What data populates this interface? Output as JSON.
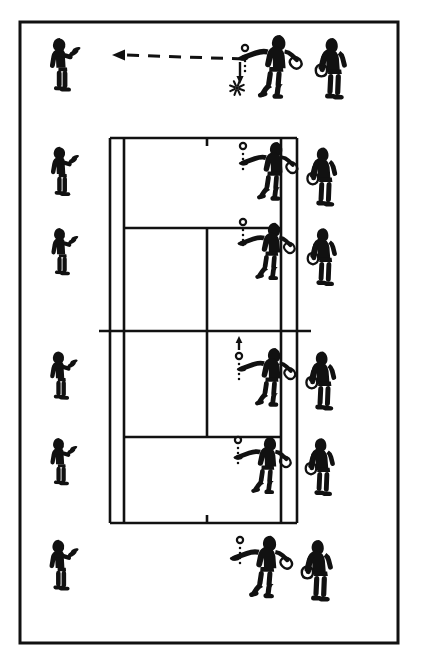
{
  "figure": {
    "background_color": "#ffffff",
    "ink_color": "#111111",
    "border": {
      "name": "figure-frame",
      "x": 20,
      "y": 22,
      "width": 378,
      "height": 621,
      "stroke_width": 3
    }
  },
  "court": {
    "name": "tennis-court",
    "orientation": "vertical",
    "stroke_width": 2.6,
    "doubles_left_x": 110,
    "singles_left_x": 124,
    "singles_right_x": 281,
    "doubles_right_x": 297,
    "top_baseline_y": 138,
    "bottom_baseline_y": 523,
    "net_y": 331,
    "top_service_line_y": 228,
    "bottom_service_line_y": 437,
    "center_service_line_x": 207,
    "net_extension_left_x": 99,
    "net_extension_right_x": 311,
    "center_mark_length": 8,
    "lines": [
      {
        "label": "top-baseline",
        "type": "horizontal"
      },
      {
        "label": "bottom-baseline",
        "type": "horizontal"
      },
      {
        "label": "net",
        "type": "horizontal"
      },
      {
        "label": "top-service-line",
        "type": "horizontal"
      },
      {
        "label": "bottom-service-line",
        "type": "horizontal"
      },
      {
        "label": "left-doubles-sideline",
        "type": "vertical"
      },
      {
        "label": "left-singles-sideline",
        "type": "vertical"
      },
      {
        "label": "right-singles-sideline",
        "type": "vertical"
      },
      {
        "label": "right-doubles-sideline",
        "type": "vertical"
      },
      {
        "label": "center-service-line",
        "type": "vertical"
      },
      {
        "label": "top-center-mark",
        "type": "tick"
      },
      {
        "label": "bottom-center-mark",
        "type": "tick"
      }
    ]
  },
  "rows": [
    {
      "id": "row-1",
      "label": "row-1-behind-baseline",
      "y": 72,
      "receiver": {
        "name": "receiver-figure",
        "x": 62,
        "y": 72,
        "scale": 1.0,
        "pose": "ready-stance-waiting"
      },
      "hitter": {
        "name": "hitter-figure",
        "x": 272,
        "y": 72,
        "scale": 1.0,
        "pose": "forehand-drop-and-hit"
      },
      "feeder": {
        "name": "next-player-figure",
        "x": 331,
        "y": 74,
        "scale": 1.0,
        "pose": "standing-with-racket"
      },
      "ball": {
        "name": "ball-marker",
        "x": 245,
        "y": 48,
        "dotted_tail": true
      },
      "bounce": {
        "name": "ball-bounce-burst",
        "x": 237,
        "y": 88,
        "show": true
      },
      "drop_arrow": {
        "name": "ball-drop-arrow",
        "x": 240,
        "y": 62,
        "length": 18,
        "show": true
      },
      "trajectory_arrow": {
        "name": "shot-direction-arrow",
        "show": true,
        "from_x": 244,
        "from_y": 59,
        "to_x": 112,
        "to_y": 55,
        "dash": "12 9",
        "head": "left"
      }
    },
    {
      "id": "row-2",
      "label": "row-2-top-deuce-area",
      "y": 178,
      "receiver": {
        "name": "receiver-figure",
        "x": 62,
        "y": 178,
        "scale": 0.92,
        "pose": "ready-stance-waiting"
      },
      "hitter": {
        "name": "hitter-figure",
        "x": 270,
        "y": 176,
        "scale": 0.92,
        "pose": "forehand-drop-and-hit"
      },
      "feeder": {
        "name": "next-player-figure",
        "x": 322,
        "y": 182,
        "scale": 0.96,
        "pose": "standing-with-racket"
      },
      "ball": {
        "name": "ball-marker",
        "x": 243,
        "y": 146,
        "dotted_tail": true
      },
      "bounce": {
        "name": "ball-bounce-burst",
        "x": 0,
        "y": 0,
        "show": false
      },
      "drop_arrow": {
        "name": "ball-drop-arrow",
        "x": 0,
        "y": 0,
        "length": 0,
        "show": false
      },
      "trajectory_arrow": {
        "name": "shot-direction-arrow",
        "show": false
      }
    },
    {
      "id": "row-3",
      "label": "row-3-top-service-box",
      "y": 258,
      "receiver": {
        "name": "receiver-figure",
        "x": 62,
        "y": 258,
        "scale": 0.88,
        "pose": "ready-stance-waiting"
      },
      "hitter": {
        "name": "hitter-figure",
        "x": 268,
        "y": 256,
        "scale": 0.9,
        "pose": "forehand-drop-and-hit"
      },
      "feeder": {
        "name": "next-player-figure",
        "x": 322,
        "y": 262,
        "scale": 0.94,
        "pose": "standing-with-racket"
      },
      "ball": {
        "name": "ball-marker",
        "x": 243,
        "y": 222,
        "dotted_tail": true
      },
      "bounce": {
        "name": "ball-bounce-burst",
        "x": 0,
        "y": 0,
        "show": false
      },
      "drop_arrow": {
        "name": "ball-drop-arrow",
        "x": 0,
        "y": 0,
        "length": 0,
        "show": false
      },
      "trajectory_arrow": {
        "name": "shot-direction-arrow",
        "show": false
      }
    },
    {
      "id": "row-4",
      "label": "row-4-below-net",
      "y": 382,
      "receiver": {
        "name": "receiver-figure",
        "x": 61,
        "y": 382,
        "scale": 0.9,
        "pose": "ready-stance-waiting"
      },
      "hitter": {
        "name": "hitter-figure",
        "x": 268,
        "y": 382,
        "scale": 0.92,
        "pose": "forehand-drop-and-hit"
      },
      "feeder": {
        "name": "next-player-figure",
        "x": 321,
        "y": 386,
        "scale": 0.96,
        "pose": "standing-with-racket"
      },
      "ball": {
        "name": "ball-marker",
        "x": 239,
        "y": 356,
        "dotted_tail": true
      },
      "bounce": {
        "name": "ball-bounce-burst",
        "x": 0,
        "y": 0,
        "show": false
      },
      "drop_arrow": {
        "name": "ball-drop-arrow",
        "x": 0,
        "y": 0,
        "length": 0,
        "show": false
      },
      "trajectory_arrow": {
        "name": "shot-direction-arrow",
        "show": false
      },
      "up_arrow": {
        "name": "ball-toss-up-arrow",
        "x": 239,
        "y": 350,
        "show": true
      }
    },
    {
      "id": "row-5",
      "label": "row-5-bottom-service-box",
      "y": 468,
      "receiver": {
        "name": "receiver-figure",
        "x": 61,
        "y": 468,
        "scale": 0.88,
        "pose": "ready-stance-waiting"
      },
      "hitter": {
        "name": "hitter-figure",
        "x": 264,
        "y": 470,
        "scale": 0.9,
        "pose": "forehand-drop-and-hit"
      },
      "feeder": {
        "name": "next-player-figure",
        "x": 320,
        "y": 472,
        "scale": 0.94,
        "pose": "standing-with-racket"
      },
      "ball": {
        "name": "ball-marker",
        "x": 238,
        "y": 440,
        "dotted_tail": true
      },
      "bounce": {
        "name": "ball-bounce-burst",
        "x": 0,
        "y": 0,
        "show": false
      },
      "drop_arrow": {
        "name": "ball-drop-arrow",
        "x": 0,
        "y": 0,
        "length": 0,
        "show": false
      },
      "trajectory_arrow": {
        "name": "shot-direction-arrow",
        "show": false
      }
    },
    {
      "id": "row-6",
      "label": "row-6-behind-bottom-baseline",
      "y": 572,
      "receiver": {
        "name": "receiver-figure",
        "x": 61,
        "y": 572,
        "scale": 0.95,
        "pose": "ready-stance-waiting"
      },
      "hitter": {
        "name": "hitter-figure",
        "x": 263,
        "y": 572,
        "scale": 0.98,
        "pose": "forehand-drop-and-hit"
      },
      "feeder": {
        "name": "next-player-figure",
        "x": 317,
        "y": 576,
        "scale": 1.0,
        "pose": "standing-with-racket"
      },
      "ball": {
        "name": "ball-marker",
        "x": 240,
        "y": 540,
        "dotted_tail": true
      },
      "bounce": {
        "name": "ball-bounce-burst",
        "x": 0,
        "y": 0,
        "show": false
      },
      "drop_arrow": {
        "name": "ball-drop-arrow",
        "x": 0,
        "y": 0,
        "length": 0,
        "show": false
      },
      "trajectory_arrow": {
        "name": "shot-direction-arrow",
        "show": false
      }
    }
  ],
  "legend": {
    "ball_symbol": "small open circle",
    "bounce_symbol": "starburst",
    "trajectory_symbol": "dashed arrow"
  }
}
